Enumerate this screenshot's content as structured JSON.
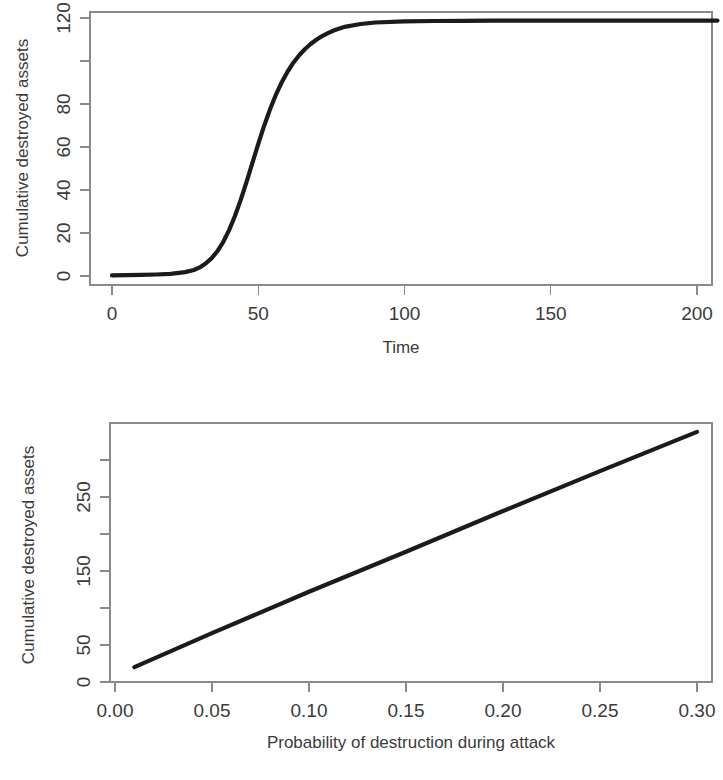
{
  "figure": {
    "background_color": "#ffffff",
    "line_color": "#1b1b1b",
    "axis_color": "#8a8a8a"
  },
  "chart_data": [
    {
      "id": "top",
      "type": "line",
      "title": "",
      "subtitle": "",
      "xlabel": "Time",
      "ylabel": "Cumulative destroyed assets",
      "xlim": [
        0,
        207
      ],
      "ylim": [
        -2,
        123
      ],
      "xticks": [
        0,
        50,
        100,
        150,
        200
      ],
      "xticklabels": [
        "0",
        "50",
        "100",
        "150",
        "200"
      ],
      "yticks": [
        0,
        20,
        40,
        60,
        80,
        100,
        120
      ],
      "yticklabels": [
        "0",
        "20",
        "40",
        "60",
        "80",
        "",
        "120"
      ],
      "grid": false,
      "legend": "none",
      "annotations": [],
      "series": [
        {
          "name": "Cumulative destroyed assets over time",
          "x": [
            0,
            5,
            10,
            15,
            20,
            25,
            28,
            30,
            32,
            34,
            36,
            38,
            40,
            42,
            44,
            46,
            48,
            50,
            52,
            54,
            56,
            58,
            60,
            62,
            64,
            66,
            68,
            70,
            72,
            74,
            76,
            78,
            80,
            85,
            90,
            100,
            110,
            120,
            130,
            140,
            150,
            160,
            170,
            180,
            190,
            200,
            207
          ],
          "y": [
            0.3,
            0.4,
            0.5,
            0.7,
            1.0,
            1.8,
            2.8,
            4.0,
            5.8,
            8.2,
            11.5,
            15.8,
            21.2,
            27.8,
            35.4,
            43.8,
            52.6,
            61.4,
            69.8,
            77.4,
            84.2,
            90.0,
            95.0,
            99.2,
            102.7,
            105.6,
            108.0,
            110.0,
            111.7,
            113.1,
            114.3,
            115.2,
            116.0,
            117.2,
            117.9,
            118.4,
            118.6,
            118.7,
            118.8,
            118.8,
            118.8,
            118.8,
            118.8,
            118.8,
            118.8,
            118.8,
            118.8
          ]
        }
      ]
    },
    {
      "id": "bottom",
      "type": "line",
      "title": "",
      "subtitle": "",
      "xlabel": "Probability of destruction during attack",
      "ylabel": "Cumulative destroyed assets",
      "xlim": [
        -0.004,
        0.311
      ],
      "ylim": [
        -8,
        352
      ],
      "xticks": [
        0.0,
        0.05,
        0.1,
        0.15,
        0.2,
        0.25,
        0.3
      ],
      "xticklabels": [
        "0.00",
        "0.05",
        "0.10",
        "0.15",
        "0.20",
        "0.25",
        "0.30"
      ],
      "yticks": [
        0,
        50,
        100,
        150,
        200,
        250,
        300
      ],
      "yticklabels": [
        "0",
        "50",
        "",
        "150",
        "",
        "250",
        ""
      ],
      "grid": false,
      "legend": "none",
      "annotations": [],
      "series": [
        {
          "name": "Cumulative destroyed assets vs probability",
          "x": [
            0.01,
            0.05,
            0.1,
            0.15,
            0.2,
            0.25,
            0.3
          ],
          "y": [
            20,
            66,
            122,
            176,
            231,
            285,
            338
          ]
        }
      ]
    }
  ]
}
